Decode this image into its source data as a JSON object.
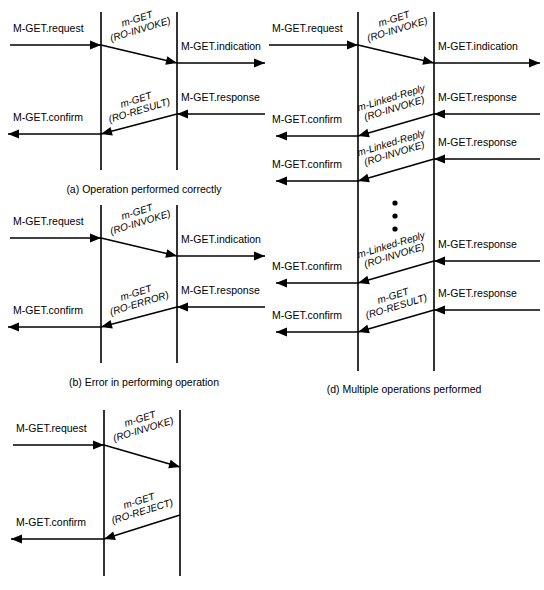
{
  "figure": {
    "width": 544,
    "height": 590,
    "background": "#ffffff",
    "ink": "#000000"
  },
  "panels": [
    {
      "id": "a",
      "caption": "(a) Operation performed correctly",
      "caption_x": 144,
      "caption_y": 193,
      "lifelines": [
        {
          "name": "left-lifeline",
          "x": 101,
          "y1": 12,
          "y2": 170
        },
        {
          "name": "right-lifeline",
          "x": 177,
          "y1": 12,
          "y2": 170
        }
      ],
      "messages": [
        {
          "name": "m-get-request",
          "kind": "horizontal-right",
          "label": "M-GET.request",
          "label_x": 13,
          "label_y": 32,
          "x1": 10,
          "x2": 101,
          "y": 45
        },
        {
          "name": "m-get-ro-invoke",
          "kind": "diagonal-right",
          "label": [
            "m-GET",
            "(RO-INVOKE)"
          ],
          "label_x": 138,
          "label_y": 22,
          "rotate": -17,
          "x1": 101,
          "y1": 45,
          "x2": 177,
          "y2": 63
        },
        {
          "name": "m-get-indication",
          "kind": "horizontal-right",
          "label": "M-GET.indication",
          "label_x": 181,
          "label_y": 50,
          "x1": 177,
          "x2": 265,
          "y": 63
        },
        {
          "name": "m-get-response",
          "kind": "horizontal-left",
          "label": "M-GET.response",
          "label_x": 181,
          "label_y": 101,
          "x1": 265,
          "x2": 177,
          "y": 114
        },
        {
          "name": "m-get-ro-result",
          "kind": "diagonal-left",
          "label": [
            "m-GET",
            "(RO-RESULT)"
          ],
          "label_x": 137,
          "label_y": 103,
          "rotate": -17,
          "x1": 177,
          "y1": 114,
          "x2": 101,
          "y2": 134
        },
        {
          "name": "m-get-confirm",
          "kind": "horizontal-left",
          "label": "M-GET.confirm",
          "label_x": 13,
          "label_y": 121,
          "x1": 101,
          "x2": 8,
          "y": 134
        }
      ]
    },
    {
      "id": "b",
      "caption": "(b) Error in performing operation",
      "caption_x": 144,
      "caption_y": 386,
      "lifelines": [
        {
          "name": "left-lifeline",
          "x": 101,
          "y1": 205,
          "y2": 363
        },
        {
          "name": "right-lifeline",
          "x": 177,
          "y1": 205,
          "y2": 363
        }
      ],
      "messages": [
        {
          "name": "m-get-request",
          "kind": "horizontal-right",
          "label": "M-GET.request",
          "label_x": 13,
          "label_y": 225,
          "x1": 10,
          "x2": 101,
          "y": 238
        },
        {
          "name": "m-get-ro-invoke",
          "kind": "diagonal-right",
          "label": [
            "m-GET",
            "(RO-INVOKE)"
          ],
          "label_x": 138,
          "label_y": 215,
          "rotate": -17,
          "x1": 101,
          "y1": 238,
          "x2": 177,
          "y2": 256
        },
        {
          "name": "m-get-indication",
          "kind": "horizontal-right",
          "label": "M-GET.indication",
          "label_x": 181,
          "label_y": 243,
          "x1": 177,
          "x2": 265,
          "y": 256
        },
        {
          "name": "m-get-response",
          "kind": "horizontal-left",
          "label": "M-GET.response",
          "label_x": 181,
          "label_y": 294,
          "x1": 265,
          "x2": 177,
          "y": 307
        },
        {
          "name": "m-get-ro-error",
          "kind": "diagonal-left",
          "label": [
            "m-GET",
            "(RO-ERROR)"
          ],
          "label_x": 137,
          "label_y": 296,
          "rotate": -17,
          "x1": 177,
          "y1": 307,
          "x2": 101,
          "y2": 327
        },
        {
          "name": "m-get-confirm",
          "kind": "horizontal-left",
          "label": "M-GET.confirm",
          "label_x": 13,
          "label_y": 314,
          "x1": 101,
          "x2": 8,
          "y": 327
        }
      ]
    },
    {
      "id": "c",
      "caption": "",
      "caption_x": 144,
      "caption_y": 586,
      "lifelines": [
        {
          "name": "left-lifeline",
          "x": 104,
          "y1": 410,
          "y2": 576
        },
        {
          "name": "right-lifeline",
          "x": 180,
          "y1": 410,
          "y2": 576
        }
      ],
      "messages": [
        {
          "name": "m-get-request",
          "kind": "horizontal-right",
          "label": "M-GET.request",
          "label_x": 16,
          "label_y": 432,
          "x1": 13,
          "x2": 104,
          "y": 445
        },
        {
          "name": "m-get-ro-invoke",
          "kind": "diagonal-right",
          "label": [
            "m-GET",
            "(RO-INVOKE)"
          ],
          "label_x": 141,
          "label_y": 422,
          "rotate": -17,
          "x1": 104,
          "y1": 445,
          "x2": 180,
          "y2": 467
        },
        {
          "name": "m-get-ro-reject",
          "kind": "diagonal-left",
          "label": [
            "m-GET",
            "(RO-REJECT)"
          ],
          "label_x": 140,
          "label_y": 504,
          "rotate": -17,
          "x1": 180,
          "y1": 515,
          "x2": 104,
          "y2": 539
        },
        {
          "name": "m-get-confirm",
          "kind": "horizontal-left",
          "label": "M-GET.confirm",
          "label_x": 16,
          "label_y": 526,
          "x1": 104,
          "x2": 11,
          "y": 539
        }
      ]
    },
    {
      "id": "d",
      "caption": "(d) Multiple operations performed",
      "caption_x": 404,
      "caption_y": 393,
      "lifelines": [
        {
          "name": "left-lifeline",
          "x": 358,
          "y1": 12,
          "y2": 371
        },
        {
          "name": "right-lifeline",
          "x": 434,
          "y1": 12,
          "y2": 371
        }
      ],
      "dots": [
        {
          "name": "continuation-dot",
          "cx": 395,
          "cy": 203,
          "r": 2.6
        },
        {
          "name": "continuation-dot",
          "cx": 395,
          "cy": 216,
          "r": 2.6
        },
        {
          "name": "continuation-dot",
          "cx": 395,
          "cy": 229,
          "r": 2.6
        }
      ],
      "messages": [
        {
          "name": "m-get-request",
          "kind": "horizontal-right",
          "label": "M-GET.request",
          "label_x": 272,
          "label_y": 32,
          "x1": 269,
          "x2": 358,
          "y": 45
        },
        {
          "name": "m-get-ro-invoke",
          "kind": "diagonal-right",
          "label": [
            "m-GET",
            "(RO-INVOKE)"
          ],
          "label_x": 395,
          "label_y": 22,
          "rotate": -17,
          "x1": 358,
          "y1": 45,
          "x2": 434,
          "y2": 63
        },
        {
          "name": "m-get-indication",
          "kind": "horizontal-right",
          "label": "M-GET.indication",
          "label_x": 438,
          "label_y": 50,
          "x1": 434,
          "x2": 540,
          "y": 63
        },
        {
          "name": "m-get-response-1",
          "kind": "horizontal-left",
          "label": "M-GET.response",
          "label_x": 438,
          "label_y": 101,
          "x1": 540,
          "x2": 434,
          "y": 114
        },
        {
          "name": "m-linked-reply-ro-invoke-1",
          "kind": "diagonal-left",
          "label": [
            "m-Linked-Reply",
            "(RO-INVOKE)"
          ],
          "label_x": 392,
          "label_y": 101,
          "rotate": -17,
          "x1": 434,
          "y1": 114,
          "x2": 358,
          "y2": 136
        },
        {
          "name": "m-get-confirm-1",
          "kind": "horizontal-left",
          "label": "M-GET.confirm",
          "label_x": 272,
          "label_y": 123,
          "x1": 358,
          "x2": 276,
          "y": 136
        },
        {
          "name": "m-get-response-2",
          "kind": "horizontal-left",
          "label": "M-GET.response",
          "label_x": 438,
          "label_y": 146,
          "x1": 540,
          "x2": 434,
          "y": 159
        },
        {
          "name": "m-linked-reply-ro-invoke-2",
          "kind": "diagonal-left",
          "label": [
            "m-Linked-Reply",
            "(RO-INVOKE)"
          ],
          "label_x": 392,
          "label_y": 146,
          "rotate": -17,
          "x1": 434,
          "y1": 159,
          "x2": 358,
          "y2": 181
        },
        {
          "name": "m-get-confirm-2",
          "kind": "horizontal-left",
          "label": "M-GET.confirm",
          "label_x": 272,
          "label_y": 168,
          "x1": 358,
          "x2": 276,
          "y": 181
        },
        {
          "name": "m-get-response-3",
          "kind": "horizontal-left",
          "label": "M-GET.response",
          "label_x": 438,
          "label_y": 248,
          "x1": 540,
          "x2": 434,
          "y": 261
        },
        {
          "name": "m-linked-reply-ro-invoke-3",
          "kind": "diagonal-left",
          "label": [
            "m-Linked-Reply",
            "(RO-INVOKE)"
          ],
          "label_x": 392,
          "label_y": 248,
          "rotate": -17,
          "x1": 434,
          "y1": 261,
          "x2": 358,
          "y2": 283
        },
        {
          "name": "m-get-confirm-3",
          "kind": "horizontal-left",
          "label": "M-GET.confirm",
          "label_x": 272,
          "label_y": 270,
          "x1": 358,
          "x2": 276,
          "y": 283
        },
        {
          "name": "m-get-response-4",
          "kind": "horizontal-left",
          "label": "M-GET.response",
          "label_x": 438,
          "label_y": 297,
          "x1": 540,
          "x2": 434,
          "y": 310
        },
        {
          "name": "m-get-ro-result",
          "kind": "diagonal-left",
          "label": [
            "m-GET",
            "(RO-RESULT)"
          ],
          "label_x": 394,
          "label_y": 299,
          "rotate": -17,
          "x1": 434,
          "y1": 310,
          "x2": 358,
          "y2": 332
        },
        {
          "name": "m-get-confirm-4",
          "kind": "horizontal-left",
          "label": "M-GET.confirm",
          "label_x": 272,
          "label_y": 319,
          "x1": 358,
          "x2": 276,
          "y": 332
        }
      ]
    }
  ]
}
